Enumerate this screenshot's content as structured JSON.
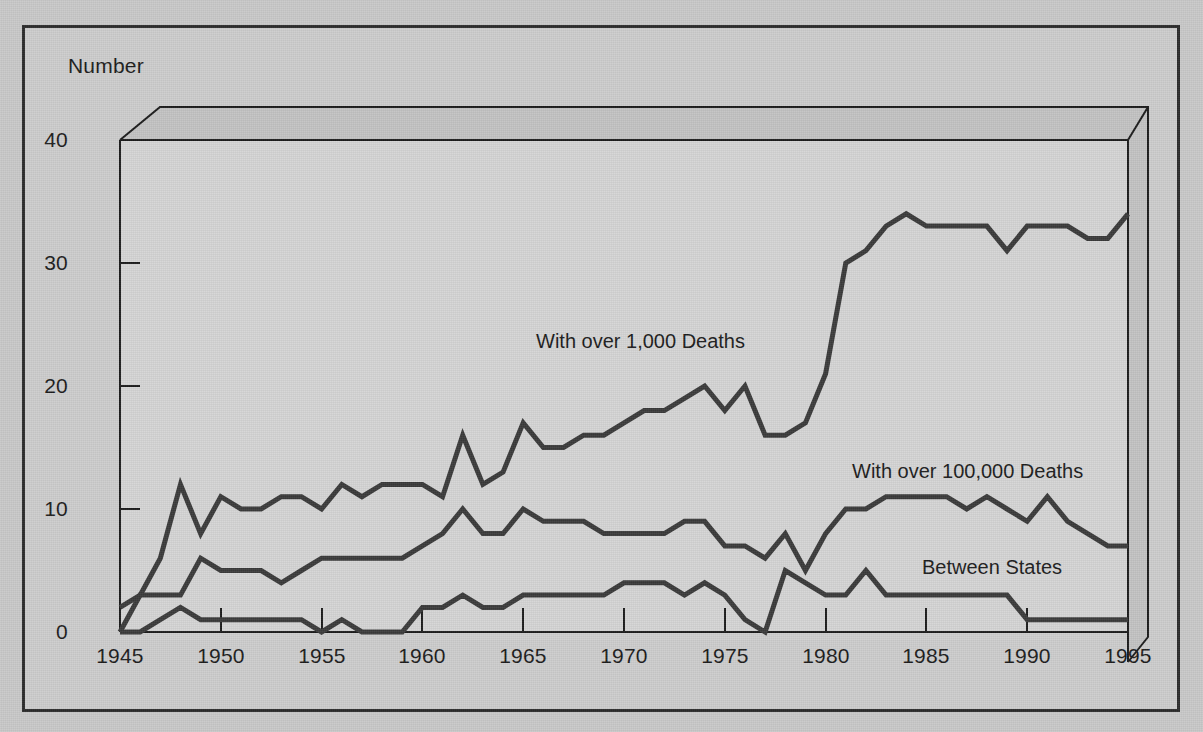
{
  "figure": {
    "background_color": "#cdcdcd",
    "border_color": "#2b2b2b",
    "plot_fill": "#d5d5d5",
    "top_face_fill": "#c3c3c3",
    "right_face_fill": "#c3c3c3",
    "line_color": "#3a3a3a",
    "axis_color": "#1b1b1b"
  },
  "axis": {
    "y_title": "Number",
    "y_ticks": [
      "0",
      "10",
      "20",
      "30",
      "40"
    ],
    "x_ticks": [
      "1945",
      "1950",
      "1955",
      "1960",
      "1965",
      "1970",
      "1975",
      "1980",
      "1985",
      "1990",
      "1995"
    ]
  },
  "labels": {
    "series1": "With over 1,000 Deaths",
    "series2": "With over 100,000 Deaths",
    "series3": "Between States"
  },
  "chart_data": {
    "type": "line",
    "title": "",
    "xlabel": "",
    "ylabel": "Number",
    "xlim": [
      1945,
      1995
    ],
    "ylim": [
      0,
      40
    ],
    "grid": false,
    "legend": "inline-annotations",
    "x": [
      1945,
      1946,
      1947,
      1948,
      1949,
      1950,
      1951,
      1952,
      1953,
      1954,
      1955,
      1956,
      1957,
      1958,
      1959,
      1960,
      1961,
      1962,
      1963,
      1964,
      1965,
      1966,
      1967,
      1968,
      1969,
      1970,
      1971,
      1972,
      1973,
      1974,
      1975,
      1976,
      1977,
      1978,
      1979,
      1980,
      1981,
      1982,
      1983,
      1984,
      1985,
      1986,
      1987,
      1988,
      1989,
      1990,
      1991,
      1992,
      1993,
      1994,
      1995
    ],
    "series": [
      {
        "name": "With over 1,000 Deaths",
        "values": [
          2,
          3,
          6,
          12,
          8,
          11,
          10,
          10,
          11,
          11,
          10,
          12,
          11,
          12,
          12,
          12,
          11,
          16,
          12,
          13,
          17,
          15,
          15,
          16,
          16,
          17,
          18,
          18,
          19,
          20,
          18,
          20,
          16,
          16,
          17,
          21,
          30,
          31,
          33,
          34,
          33,
          33,
          33,
          33,
          31,
          33,
          33,
          33,
          32,
          32,
          34
        ]
      },
      {
        "name": "With over 100,000 Deaths",
        "values": [
          0,
          3,
          3,
          3,
          6,
          5,
          5,
          5,
          4,
          5,
          6,
          6,
          6,
          6,
          6,
          7,
          8,
          10,
          8,
          8,
          10,
          9,
          9,
          9,
          8,
          8,
          8,
          8,
          9,
          9,
          7,
          7,
          6,
          8,
          5,
          8,
          10,
          10,
          11,
          11,
          11,
          11,
          10,
          11,
          10,
          9,
          11,
          9,
          8,
          7,
          7
        ]
      },
      {
        "name": "Between States",
        "values": [
          0,
          0,
          1,
          2,
          1,
          1,
          1,
          1,
          1,
          1,
          0,
          1,
          0,
          0,
          0,
          2,
          2,
          3,
          2,
          2,
          3,
          3,
          3,
          3,
          3,
          4,
          4,
          4,
          3,
          4,
          3,
          1,
          0,
          5,
          4,
          3,
          3,
          5,
          3,
          3,
          3,
          3,
          3,
          3,
          3,
          1,
          1,
          1,
          1,
          1,
          1
        ]
      }
    ]
  },
  "annotation_positions": {
    "series1": {
      "x": 536,
      "y": 330
    },
    "series2": {
      "x": 852,
      "y": 460
    },
    "series3": {
      "x": 922,
      "y": 556
    }
  }
}
